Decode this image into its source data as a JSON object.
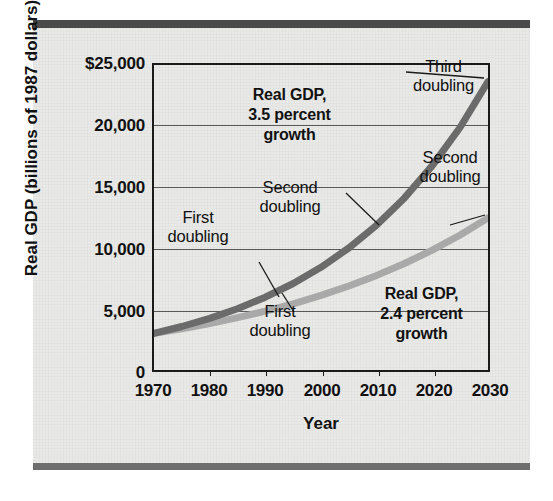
{
  "chart_data": {
    "type": "line",
    "title": "",
    "xlabel": "Year",
    "ylabel": "Real GDP (billions of 1987 dollars)",
    "xlim": [
      1970,
      2030
    ],
    "ylim": [
      0,
      25000
    ],
    "grid": true,
    "legend_position": "none",
    "x_ticks": [
      "1970",
      "1980",
      "1990",
      "2000",
      "2010",
      "2020",
      "2030"
    ],
    "x_tick_values": [
      1970,
      1980,
      1990,
      2000,
      2010,
      2020,
      2030
    ],
    "y_ticks": [
      "0",
      "5,000",
      "10,000",
      "15,000",
      "20,000",
      "$25,000"
    ],
    "y_tick_values": [
      0,
      5000,
      10000,
      15000,
      20000,
      25000
    ],
    "x": [
      1970,
      1975,
      1980,
      1985,
      1990,
      1995,
      2000,
      2005,
      2010,
      2015,
      2020,
      2025,
      2030
    ],
    "series": [
      {
        "name": "Real GDP, 3.5 percent growth",
        "color": "#6b6b6b",
        "values": [
          3000,
          3563,
          4232,
          5026,
          5970,
          7091,
          8421,
          10002,
          11880,
          14109,
          16757,
          19903,
          23639
        ]
      },
      {
        "name": "Real GDP, 2.4 percent growth",
        "color": "#a9a9a9",
        "values": [
          3000,
          3378,
          3804,
          4283,
          4822,
          5429,
          6113,
          6883,
          7750,
          8727,
          9826,
          11063,
          12456
        ]
      }
    ],
    "annotations": [
      {
        "id": "third-doubling",
        "text": "Third\ndoubling",
        "style": "plain",
        "target_series": "Real GDP, 3.5 percent growth"
      },
      {
        "id": "upper-label",
        "text": "Real GDP,\n3.5 percent\ngrowth",
        "style": "bold",
        "target_series": "Real GDP, 3.5 percent growth"
      },
      {
        "id": "second-doubling-right",
        "text": "Second\ndoubling",
        "style": "plain",
        "target_series": "Real GDP, 2.4 percent growth"
      },
      {
        "id": "second-doubling-mid",
        "text": "Second\ndoubling",
        "style": "plain",
        "target_series": "Real GDP, 3.5 percent growth"
      },
      {
        "id": "first-doubling-upper",
        "text": "First\ndoubling",
        "style": "plain",
        "target_series": "Real GDP, 3.5 percent growth"
      },
      {
        "id": "first-doubling-lower",
        "text": "First\ndoubling",
        "style": "plain",
        "target_series": "Real GDP, 2.4 percent growth"
      },
      {
        "id": "lower-label",
        "text": "Real GDP,\n2.4 percent\ngrowth",
        "style": "bold",
        "target_series": "Real GDP, 2.4 percent growth"
      }
    ]
  },
  "axis": {
    "y_title": "Real GDP (billions of 1987 dollars)",
    "x_title": "Year",
    "y_tick_0": "0",
    "y_tick_1": "5,000",
    "y_tick_2": "10,000",
    "y_tick_3": "15,000",
    "y_tick_4": "20,000",
    "y_tick_5": "$25,000",
    "x_tick_0": "1970",
    "x_tick_1": "1980",
    "x_tick_2": "1990",
    "x_tick_3": "2000",
    "x_tick_4": "2010",
    "x_tick_5": "2020",
    "x_tick_6": "2030"
  },
  "annotations": {
    "third_doubling": "Third\ndoubling",
    "upper_series_label": "Real GDP,\n3.5 percent\ngrowth",
    "second_doubling_right": "Second\ndoubling",
    "second_doubling_mid": "Second\ndoubling",
    "first_doubling_upper": "First\ndoubling",
    "first_doubling_lower": "First\ndoubling",
    "lower_series_label": "Real GDP,\n2.4 percent\ngrowth"
  },
  "colors": {
    "upper_curve": "#6b6b6b",
    "lower_curve": "#a9a9a9",
    "frame": "#1a1a1a",
    "gridline": "#595959",
    "card_background": "#e9e9e7",
    "bar": "#4a4a4a"
  }
}
